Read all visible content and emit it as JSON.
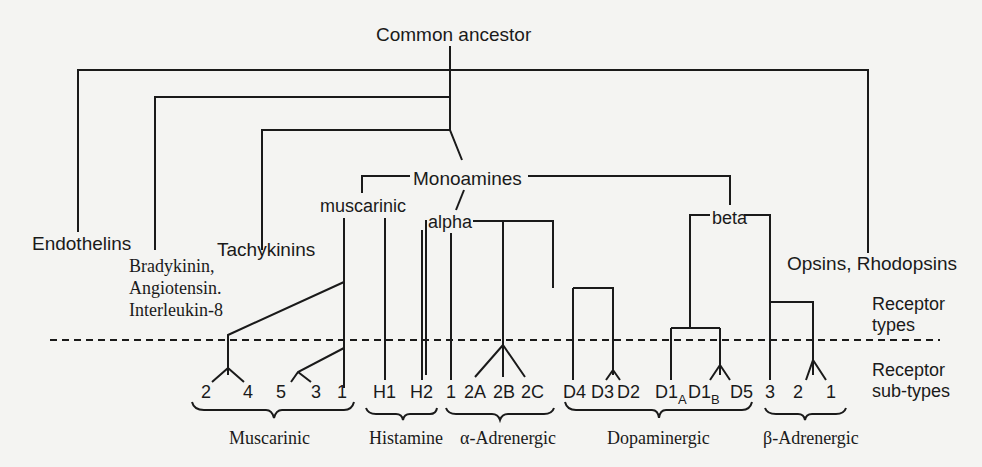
{
  "title": "Common ancestor",
  "families": {
    "endothelins": "Endothelins",
    "bradykinin_line1": "Bradykinin,",
    "bradykinin_line2": "Angiotensin.",
    "bradykinin_line3": "Interleukin-8",
    "tachykinins": "Tachykinins",
    "opsins": "Opsins, Rhodopsins",
    "monoamines": "Monoamines",
    "muscarinic": "muscarinic",
    "alpha": "alpha",
    "beta": "beta"
  },
  "levels": {
    "receptor_types_line1": "Receptor",
    "receptor_types_line2": "types",
    "receptor_subtypes_line1": "Receptor",
    "receptor_subtypes_line2": "sub-types"
  },
  "subtypes": {
    "muscarinic": [
      "2",
      "4",
      "5",
      "3",
      "1"
    ],
    "histamine": [
      "H1",
      "H2"
    ],
    "alpha_adrenergic": [
      "1",
      "2A",
      "2B",
      "2C"
    ],
    "dopaminergic": [
      "D4",
      "D3",
      "D2",
      "D1",
      "A",
      "D1",
      "B",
      "D5"
    ],
    "beta_adrenergic": [
      "3",
      "2",
      "1"
    ]
  },
  "groups": {
    "muscarinic": "Muscarinic",
    "histamine": "Histamine",
    "alpha_adrenergic": "α-Adrenergic",
    "dopaminergic": "Dopaminergic",
    "beta_adrenergic": "β-Adrenergic"
  }
}
